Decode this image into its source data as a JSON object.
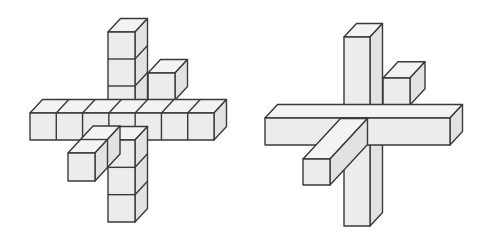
{
  "colors": {
    "background": "#ffffff",
    "front": "#ececec",
    "top": "#f3f3f3",
    "side": "#e2e2e2",
    "stroke": "#3a3a3a"
  },
  "depth_offset": {
    "dx": 12.5,
    "dy": -13.5
  },
  "figures": [
    {
      "name": "cube-cross-figure",
      "description": "3D cross made of unit cubes",
      "unit": 26.5,
      "segmented": true,
      "parts": [
        {
          "name": "back-depth-arm",
          "type": "depth",
          "x": 148,
          "y": 73,
          "w": 27,
          "h": 27,
          "back_steps": 1
        },
        {
          "name": "vertical-arm-top",
          "type": "box",
          "x": 108,
          "y": 32,
          "w": 27,
          "h": 81,
          "cubes_v": 3
        },
        {
          "name": "horizontal-arm",
          "type": "box",
          "x": 30,
          "y": 113,
          "w": 184,
          "h": 27,
          "cubes_h": 7
        },
        {
          "name": "vertical-arm-bottom",
          "type": "box",
          "x": 108,
          "y": 140,
          "w": 27,
          "h": 82,
          "cubes_v": 3
        },
        {
          "name": "front-depth-arm",
          "type": "depth-front",
          "x": 68,
          "y": 153,
          "w": 27,
          "h": 28,
          "steps": 2
        }
      ]
    },
    {
      "name": "solid-bar-cross-figure",
      "description": "3D cross made of solid bars",
      "segmented": false,
      "parts": [
        {
          "name": "back-depth-bar",
          "type": "depth",
          "x": 383,
          "y": 78,
          "w": 27,
          "h": 27,
          "back_steps": 1.2
        },
        {
          "name": "vertical-bar",
          "type": "box",
          "x": 344,
          "y": 37,
          "w": 26,
          "h": 189
        },
        {
          "name": "horizontal-bar",
          "type": "box",
          "x": 265,
          "y": 118,
          "w": 185,
          "h": 27
        },
        {
          "name": "front-depth-bar",
          "type": "depth-front",
          "x": 303,
          "y": 159,
          "w": 27,
          "h": 26,
          "steps": 3
        }
      ]
    }
  ]
}
